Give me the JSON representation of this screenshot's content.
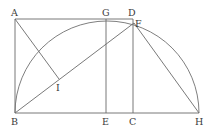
{
  "diagram": {
    "type": "geometric-construction",
    "stroke_color": "#6a6a6a",
    "label_color": "#3a3a3a",
    "points": {
      "A": {
        "x": 15,
        "y": 19,
        "label": "A"
      },
      "B": {
        "x": 15,
        "y": 113,
        "label": "B"
      },
      "G": {
        "x": 106,
        "y": 19,
        "label": "G"
      },
      "D": {
        "x": 133,
        "y": 19,
        "label": "D"
      },
      "F": {
        "x": 134,
        "y": 23,
        "label": "F"
      },
      "E": {
        "x": 106,
        "y": 113,
        "label": "E"
      },
      "C": {
        "x": 133,
        "y": 113,
        "label": "C"
      },
      "H": {
        "x": 199,
        "y": 113,
        "label": "H"
      },
      "I": {
        "x": 59,
        "y": 79,
        "label": "I"
      }
    },
    "segments": [
      [
        "A",
        "D"
      ],
      [
        "A",
        "B"
      ],
      [
        "B",
        "H"
      ],
      [
        "D",
        "C"
      ],
      [
        "G",
        "E"
      ],
      [
        "A",
        "I"
      ],
      [
        "B",
        "F"
      ],
      [
        "F",
        "H"
      ]
    ],
    "arc": {
      "from": "B",
      "to": "H",
      "center_x": 107,
      "center_y": 113,
      "radius": 92,
      "kind": "semicircle"
    },
    "labels": {
      "A": "A",
      "G": "G",
      "D": "D",
      "F": "F",
      "I": "I",
      "B": "B",
      "E": "E",
      "C": "C",
      "H": "H"
    }
  }
}
